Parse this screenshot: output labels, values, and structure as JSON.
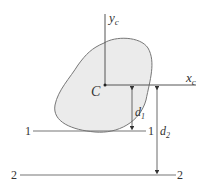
{
  "diagram": {
    "centroid_label": "C",
    "axes": {
      "y_axis": {
        "label": "y",
        "subscript": "c"
      },
      "x_axis": {
        "label": "x",
        "subscript": "c"
      }
    },
    "lines": [
      {
        "id": "1",
        "left_label": "1",
        "right_label": "1"
      },
      {
        "id": "2",
        "left_label": "2",
        "right_label": "2"
      }
    ],
    "dimensions": [
      {
        "label": "d",
        "subscript": "1",
        "from": "x_c axis",
        "to": "line 1-1"
      },
      {
        "label": "d",
        "subscript": "2",
        "from": "x_c axis",
        "to": "line 2-2"
      }
    ],
    "colors": {
      "shape_fill": "#ebebeb",
      "shape_stroke": "#777777",
      "line": "#555555",
      "text": "#333333"
    }
  }
}
